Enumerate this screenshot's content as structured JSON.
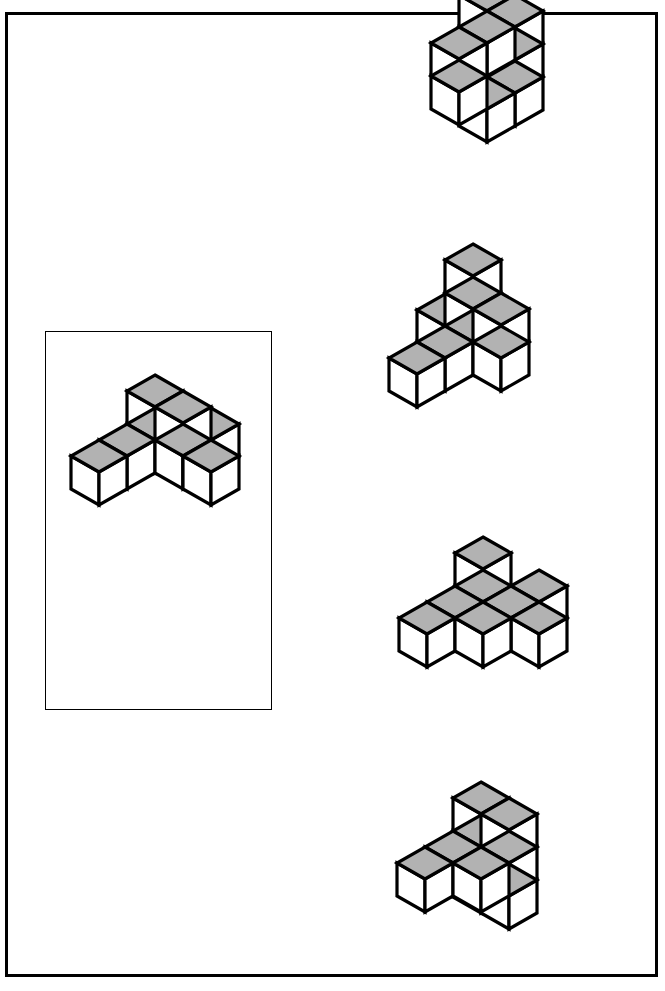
{
  "page": {
    "width": 665,
    "height": 991,
    "background": "#ffffff"
  },
  "style": {
    "line_color": "#000000",
    "top_face_color": "#b2b2b2",
    "side_face_color": "#ffffff",
    "outer_frame_stroke": 3,
    "reference_box_stroke": 1
  },
  "outer_frame": {
    "x": 5,
    "y": 12,
    "width": 653,
    "height": 965
  },
  "reference_box": {
    "x": 37,
    "y": 316,
    "width": 227,
    "height": 379
  },
  "iso": {
    "unit_x": 28,
    "unit_y": 16,
    "unit_z": 33,
    "note": "isometric projection: screen = (x-y)*unit_x , (x+y)*unit_y - z*unit_z"
  },
  "figures": [
    {
      "id": "reference",
      "label": "reference-figure",
      "role": "stimulus",
      "origin": {
        "x": 152,
        "y": 438
      },
      "scale": 1.0,
      "cube_count": 8,
      "cubes": [
        {
          "x": 0,
          "y": 0,
          "z": 1
        },
        {
          "x": 1,
          "y": 0,
          "z": 1
        },
        {
          "x": 0,
          "y": 0,
          "z": 0
        },
        {
          "x": 0,
          "y": 1,
          "z": 0
        },
        {
          "x": 0,
          "y": 2,
          "z": 0
        },
        {
          "x": 1,
          "y": 0,
          "z": 0
        },
        {
          "x": 2,
          "y": 0,
          "z": 0
        },
        {
          "x": 1,
          "y": -1,
          "z": 0
        }
      ]
    },
    {
      "id": "option-a",
      "label": "option-figure-a",
      "role": "answer-option",
      "index": 1,
      "origin": {
        "x": 484,
        "y": 75
      },
      "scale": 1.0,
      "cube_count": 9,
      "cubes": [
        {
          "x": 0,
          "y": 0,
          "z": 2
        },
        {
          "x": 1,
          "y": 0,
          "z": 2
        },
        {
          "x": 1,
          "y": 1,
          "z": 2
        },
        {
          "x": 1,
          "y": 2,
          "z": 2
        },
        {
          "x": 1,
          "y": 2,
          "z": 1
        },
        {
          "x": 1,
          "y": 0,
          "z": 1
        },
        {
          "x": 1,
          "y": 0,
          "z": 0
        },
        {
          "x": 1,
          "y": 1,
          "z": 0
        },
        {
          "x": 0,
          "y": 0,
          "z": 0
        }
      ]
    },
    {
      "id": "option-b",
      "label": "option-figure-b",
      "role": "answer-option",
      "index": 2,
      "origin": {
        "x": 470,
        "y": 340
      },
      "scale": 1.0,
      "cube_count": 8,
      "cubes": [
        {
          "x": 0,
          "y": 0,
          "z": 0
        },
        {
          "x": 0,
          "y": 1,
          "z": 0
        },
        {
          "x": 0,
          "y": 2,
          "z": 0
        },
        {
          "x": 1,
          "y": 0,
          "z": 0
        },
        {
          "x": 0,
          "y": 0,
          "z": 1
        },
        {
          "x": 0,
          "y": 0,
          "z": 2
        },
        {
          "x": 1,
          "y": 0,
          "z": 1
        },
        {
          "x": -1,
          "y": 0,
          "z": 0
        }
      ]
    },
    {
      "id": "option-c",
      "label": "option-figure-c",
      "role": "answer-option",
      "index": 3,
      "origin": {
        "x": 480,
        "y": 600
      },
      "scale": 1.0,
      "cube_count": 8,
      "cubes": [
        {
          "x": 0,
          "y": 0,
          "z": 1
        },
        {
          "x": 0,
          "y": 0,
          "z": 0
        },
        {
          "x": 0,
          "y": 1,
          "z": 0
        },
        {
          "x": 0,
          "y": 2,
          "z": 0
        },
        {
          "x": 1,
          "y": 0,
          "z": 0
        },
        {
          "x": 2,
          "y": 0,
          "z": 0
        },
        {
          "x": 1,
          "y": 1,
          "z": 0
        },
        {
          "x": 1,
          "y": -1,
          "z": 0
        }
      ]
    },
    {
      "id": "option-d",
      "label": "option-figure-d",
      "role": "answer-option",
      "index": 4,
      "origin": {
        "x": 478,
        "y": 845
      },
      "scale": 1.0,
      "cube_count": 9,
      "cubes": [
        {
          "x": 0,
          "y": 0,
          "z": 1
        },
        {
          "x": 0,
          "y": 0,
          "z": 0
        },
        {
          "x": 1,
          "y": 0,
          "z": 0
        },
        {
          "x": 1,
          "y": 0,
          "z": 1
        },
        {
          "x": 0,
          "y": 1,
          "z": 0
        },
        {
          "x": 0,
          "y": 2,
          "z": 0
        },
        {
          "x": 1,
          "y": 1,
          "z": 0
        },
        {
          "x": 0,
          "y": 0,
          "z": -1
        },
        {
          "x": 1,
          "y": 0,
          "z": -1
        }
      ]
    }
  ]
}
